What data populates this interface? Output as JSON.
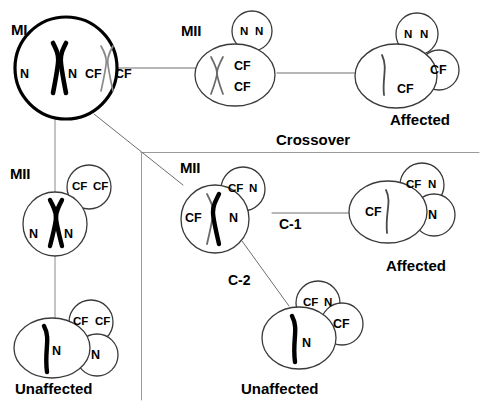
{
  "diagram": {
    "title_text": "Meiosis nondisjunction with and without crossover",
    "divider_label": "Crossover",
    "phase_labels": {
      "mi": "MI",
      "mii_top": "MII",
      "mii_left": "MII",
      "mii_bottom": "MII"
    },
    "crossover_links": {
      "c1": "C-1",
      "c2": "C-2"
    },
    "outcomes": {
      "top_right": "Affected",
      "left_bottom": "Unaffected",
      "right_middle": "Affected",
      "bottom_center": "Unaffected"
    },
    "alleles": {
      "n": "N",
      "cf": "CF"
    },
    "colors": {
      "ink": "#000000",
      "background": "#ffffff",
      "cell_outline": "#3a3a3a",
      "divider": "#9a9a9a",
      "connector": "#8a8a8a",
      "chromosome_mutant": "#000000",
      "chromosome_normal": "#7a7a7a"
    },
    "cells": [
      {
        "id": "mi-cell",
        "stage": "MI",
        "alleles": [
          "N",
          "N",
          "CF",
          "CF"
        ],
        "outcome": null
      },
      {
        "id": "mii-top-cell",
        "stage": "MII",
        "alleles": [
          "CF",
          "CF"
        ],
        "polar_body_alleles": [
          "N",
          "N"
        ],
        "outcome": null
      },
      {
        "id": "top-right-gamete",
        "stage": null,
        "alleles": [
          "CF"
        ],
        "polar_body_alleles": [
          "N",
          "N"
        ],
        "second_polar_body_alleles": [
          "CF"
        ],
        "outcome": "Affected"
      },
      {
        "id": "mii-left-cell",
        "stage": "MII",
        "alleles": [
          "N",
          "N"
        ],
        "polar_body_alleles": [
          "CF",
          "CF"
        ],
        "outcome": null
      },
      {
        "id": "left-bottom-gamete",
        "stage": null,
        "alleles": [
          "N"
        ],
        "polar_body_alleles": [
          "CF",
          "CF"
        ],
        "second_polar_body_alleles": [
          "N"
        ],
        "outcome": "Unaffected"
      },
      {
        "id": "mii-bottom-cell",
        "stage": "MII",
        "alleles": [
          "CF",
          "N"
        ],
        "polar_body_alleles": [
          "CF",
          "N"
        ],
        "outcome": null
      },
      {
        "id": "c1-gamete",
        "stage": null,
        "alleles": [
          "CF"
        ],
        "polar_body_alleles": [
          "CF",
          "N"
        ],
        "second_polar_body_alleles": [
          "N"
        ],
        "outcome": "Affected"
      },
      {
        "id": "c2-gamete",
        "stage": null,
        "alleles": [
          "N"
        ],
        "polar_body_alleles": [
          "CF",
          "N"
        ],
        "second_polar_body_alleles": [
          "CF"
        ],
        "outcome": "Unaffected"
      }
    ]
  }
}
